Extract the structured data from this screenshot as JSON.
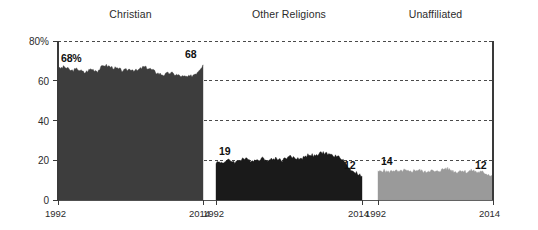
{
  "chart_data": {
    "type": "area",
    "title": "",
    "subtitle": "",
    "xlabel": "",
    "ylabel": "",
    "ylim": [
      0,
      80
    ],
    "xlim": [
      1992,
      2014
    ],
    "grid": true,
    "grid_style": "dashed-horizontal",
    "legend": "none",
    "layout": "small-multiples-3-panels",
    "y_ticks": [
      "80%",
      "60",
      "40",
      "20",
      "0"
    ],
    "y_tick_values": [
      80,
      60,
      40,
      20,
      0
    ],
    "x_ticks": [
      "1992",
      "2014"
    ],
    "x_tick_values": [
      1992,
      2014
    ],
    "panels": [
      {
        "label": "Christian",
        "color": "#3d3d3d",
        "start_label": "68%",
        "end_label": "68",
        "start_value": 68,
        "end_value": 68,
        "x": [
          1992,
          1993,
          1994,
          1995,
          1996,
          1997,
          1998,
          1999,
          2000,
          2001,
          2002,
          2003,
          2004,
          2005,
          2006,
          2007,
          2008,
          2009,
          2010,
          2011,
          2012,
          2013,
          2014
        ],
        "values": [
          66,
          67,
          65,
          66,
          64,
          66,
          65,
          68,
          67,
          66,
          65,
          66,
          65,
          67,
          66,
          64,
          63,
          64,
          63,
          62,
          62,
          64,
          68
        ]
      },
      {
        "label": "Other Religions",
        "color": "#1a1a1a",
        "start_label": "19",
        "end_label": "12",
        "start_value": 19,
        "end_value": 12,
        "x": [
          1992,
          1993,
          1994,
          1995,
          1996,
          1997,
          1998,
          1999,
          2000,
          2001,
          2002,
          2003,
          2004,
          2005,
          2006,
          2007,
          2008,
          2009,
          2010,
          2011,
          2012,
          2013,
          2014
        ],
        "values": [
          19,
          19,
          20,
          19,
          21,
          20,
          20,
          21,
          20,
          21,
          20,
          22,
          21,
          21,
          23,
          22,
          24,
          23,
          22,
          21,
          16,
          14,
          12
        ]
      },
      {
        "label": "Unaffiliated",
        "color": "#9a9a9a",
        "start_label": "14",
        "end_label": "12",
        "start_value": 14,
        "end_value": 12,
        "x": [
          1992,
          1993,
          1994,
          1995,
          1996,
          1997,
          1998,
          1999,
          2000,
          2001,
          2002,
          2003,
          2004,
          2005,
          2006,
          2007,
          2008,
          2009,
          2010,
          2011,
          2012,
          2013,
          2014
        ],
        "values": [
          14,
          15,
          14,
          15,
          14,
          15,
          14,
          15,
          15,
          14,
          15,
          14,
          15,
          16,
          15,
          14,
          15,
          14,
          15,
          14,
          14,
          13,
          12
        ]
      }
    ]
  },
  "geometry": {
    "plot_top_y": 41,
    "plot_bottom_y": 200,
    "panel_bounds": [
      [
        58,
        203
      ],
      [
        216,
        362
      ],
      [
        378,
        493
      ]
    ]
  }
}
